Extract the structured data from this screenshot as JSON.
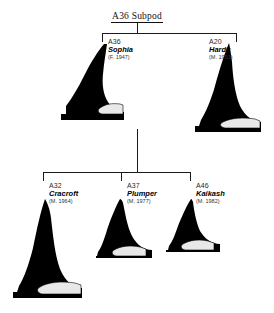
{
  "header": {
    "title": "A36 Subpod"
  },
  "whales": [
    {
      "key": "a36",
      "id": "A36",
      "name": "Sophia",
      "dates": "(F. 1947)",
      "generation": "parent",
      "fin_icon": "dorsal-fin-female-icon"
    },
    {
      "key": "a20",
      "id": "A20",
      "name": "Hardy",
      "dates": "(M. 1953)",
      "generation": "parent",
      "fin_icon": "dorsal-fin-male-icon"
    },
    {
      "key": "a32",
      "id": "A32",
      "name": "Cracroft",
      "dates": "(M. 1964)",
      "generation": "offspring",
      "fin_icon": "dorsal-fin-male-icon"
    },
    {
      "key": "a37",
      "id": "A37",
      "name": "Plumper",
      "dates": "(M. 1977)",
      "generation": "offspring",
      "fin_icon": "dorsal-fin-male-icon"
    },
    {
      "key": "a46",
      "id": "A46",
      "name": "Kaikash",
      "dates": "(M. 1982)",
      "generation": "offspring",
      "fin_icon": "dorsal-fin-male-icon"
    }
  ],
  "colors": {
    "fin_body": "#000000",
    "saddle_patch": "#e8e8e8",
    "line": "#1a1a1a",
    "background": "#ffffff",
    "text": "#1a1a1a"
  }
}
